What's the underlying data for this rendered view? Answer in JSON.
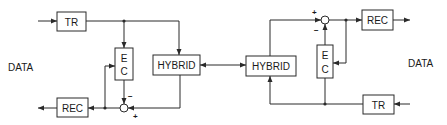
{
  "diagram": {
    "title": "",
    "left_station": {
      "data_label": "DATA",
      "transmitter": "TR",
      "receiver": "REC",
      "echo_canceller": [
        "E",
        "C"
      ],
      "hybrid": "HYBRID",
      "summer_signs": {
        "minus": "−",
        "plus": "+"
      }
    },
    "right_station": {
      "data_label": "DATA",
      "transmitter": "TR",
      "receiver": "REC",
      "echo_canceller": [
        "E",
        "C"
      ],
      "hybrid": "HYBRID",
      "summer_signs": {
        "minus": "−",
        "plus": "+"
      }
    },
    "link": "bidirectional line between hybrids",
    "colors": {
      "line": "#2a2a2a",
      "background": "#ffffff"
    }
  }
}
